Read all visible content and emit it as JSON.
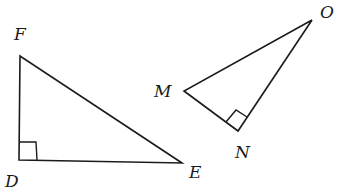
{
  "diagram": {
    "type": "geometry",
    "triangles": [
      {
        "name": "DEF",
        "right_angle_at": "D",
        "vertices": [
          {
            "label": "F",
            "x": 20,
            "y": 56,
            "label_x": 14,
            "label_y": 40
          },
          {
            "label": "D",
            "x": 19,
            "y": 160,
            "label_x": 5,
            "label_y": 187
          },
          {
            "label": "E",
            "x": 182,
            "y": 163,
            "label_x": 189,
            "label_y": 178
          }
        ]
      },
      {
        "name": "MNO",
        "right_angle_at": "N",
        "vertices": [
          {
            "label": "M",
            "x": 184,
            "y": 91,
            "label_x": 154,
            "label_y": 97
          },
          {
            "label": "O",
            "x": 312,
            "y": 20,
            "label_x": 320,
            "label_y": 18
          },
          {
            "label": "N",
            "x": 238,
            "y": 131,
            "label_x": 235,
            "label_y": 158
          }
        ]
      }
    ],
    "colors": {
      "line": "#1a1a1a",
      "background": "#ffffff"
    }
  }
}
